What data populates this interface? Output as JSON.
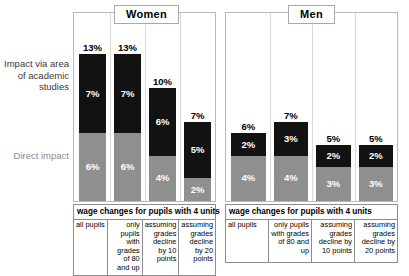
{
  "axis": {
    "top_label": "Impact via area of academic studies",
    "bottom_label": "Direct impact"
  },
  "colors": {
    "dark_segment": "#121212",
    "light_segment": "#8f8f8f",
    "top_label_color": "#3a3a3a",
    "bottom_label_color": "#8c8c8c"
  },
  "panels": [
    {
      "title": "Women",
      "table_header": "wage changes for pupils with 4 units",
      "columns": [
        "all pupils",
        "only pupils with grades of 80 and up",
        "assuming grades decline by 10 points",
        "assuming grades decline by 20 points"
      ]
    },
    {
      "title": "Men",
      "table_header": "wage changes for pupils with 4 units",
      "columns": [
        "all pupils",
        "only pupils with grades of 80 and up",
        "assuming grades decline by 10 points",
        "assuming grades decline by 20 points"
      ]
    }
  ],
  "chart_data": {
    "type": "bar",
    "title": "",
    "subtitle": "",
    "xlabel": "",
    "ylabel": "",
    "stacked": true,
    "grid": false,
    "legend_position": "left",
    "legend": [
      {
        "name": "Impact via area of academic studies",
        "color": "#121212"
      },
      {
        "name": "Direct impact",
        "color": "#8f8f8f"
      }
    ],
    "panels": [
      {
        "name": "Women",
        "categories": [
          "all pupils",
          "only pupils with grades of 80 and up",
          "assuming grades decline by 10 points",
          "assuming grades decline by 20 points"
        ],
        "series": [
          {
            "name": "Impact via area of academic studies",
            "values": [
              7,
              7,
              6,
              5
            ]
          },
          {
            "name": "Direct impact",
            "values": [
              6,
              6,
              4,
              2
            ]
          }
        ],
        "totals": [
          13,
          13,
          10,
          7
        ],
        "labels": {
          "dark": [
            "7%",
            "7%",
            "6%",
            "5%"
          ],
          "light": [
            "6%",
            "6%",
            "4%",
            "2%"
          ],
          "total": [
            "13%",
            "13%",
            "10%",
            "7%"
          ]
        }
      },
      {
        "name": "Men",
        "categories": [
          "all pupils",
          "only pupils with grades of 80 and up",
          "assuming grades decline by 10 points",
          "assuming grades decline by 20 points"
        ],
        "series": [
          {
            "name": "Impact via area of academic studies",
            "values": [
              2,
              3,
              2,
              2
            ]
          },
          {
            "name": "Direct impact",
            "values": [
              4,
              4,
              3,
              3
            ]
          }
        ],
        "totals": [
          6,
          7,
          5,
          5
        ],
        "labels": {
          "dark": [
            "2%",
            "3%",
            "2%",
            "2%"
          ],
          "light": [
            "4%",
            "4%",
            "3%",
            "3%"
          ],
          "total": [
            "6%",
            "7%",
            "5%",
            "5%"
          ]
        }
      }
    ],
    "ylim": [
      0,
      14
    ],
    "unit": "%"
  }
}
